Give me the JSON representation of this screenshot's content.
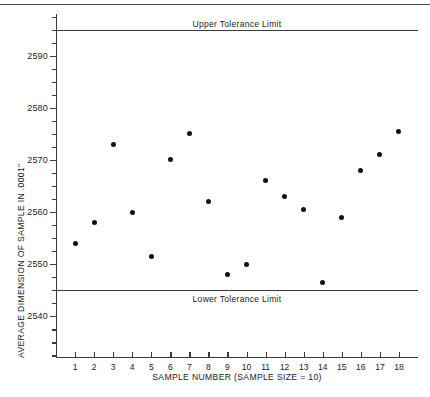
{
  "figure": {
    "background": "#ffffff",
    "rule_color": "#4a4a4a"
  },
  "chart_data": {
    "type": "scatter",
    "title": "",
    "xlabel": "SAMPLE NUMBER (SAMPLE SIZE = 10)",
    "ylabel": "AVERAGE DIMENSION OF SAMPLE IN .0001''",
    "xlim": [
      0,
      19
    ],
    "ylim": [
      2532,
      2598
    ],
    "grid": false,
    "legend": "none",
    "marker_color": "#111111",
    "x": [
      1,
      2,
      3,
      4,
      5,
      6,
      7,
      8,
      9,
      10,
      11,
      12,
      13,
      14,
      15,
      16,
      17,
      18
    ],
    "values": [
      2554,
      2558,
      2573,
      2560,
      2551.5,
      2570,
      2575,
      2562,
      2548,
      2550,
      2566,
      2563,
      2560.5,
      2546.5,
      2559,
      2568,
      2571,
      2575.5
    ],
    "y_ticks": [
      2590,
      2580,
      2570,
      2560,
      2550,
      2540
    ],
    "y_tick_labels": [
      "2590",
      "2580",
      "2570",
      "2560",
      "2550",
      "2540"
    ],
    "y_minor_step": 2.5,
    "x_ticks": [
      1,
      2,
      3,
      4,
      5,
      6,
      7,
      8,
      9,
      10,
      11,
      12,
      13,
      14,
      15,
      16,
      17,
      18
    ],
    "x_tick_labels": [
      "1",
      "2",
      "3",
      "4",
      "5",
      "6",
      "7",
      "8",
      "9",
      "10",
      "11",
      "12",
      "13",
      "14",
      "15",
      "16",
      "17",
      "18"
    ],
    "annotations": [
      {
        "name": "upper-tolerance-limit",
        "label": "Upper Tolerance Limit",
        "value": 2595,
        "label_x": 9.5,
        "label_offset": -11
      },
      {
        "name": "lower-tolerance-limit",
        "label": "Lower Tolerance Limit",
        "value": 2545,
        "label_x": 9.5,
        "label_offset": 4
      }
    ]
  }
}
